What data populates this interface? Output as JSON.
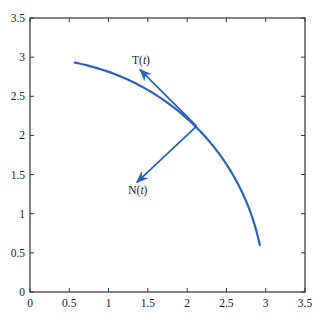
{
  "chart_data": {
    "type": "line",
    "title": "",
    "xlabel": "",
    "ylabel": "",
    "xlim": [
      0,
      3.5
    ],
    "ylim": [
      0,
      3.5
    ],
    "grid": false,
    "x_ticks": [
      "0",
      "0.5",
      "1",
      "1.5",
      "2",
      "2.5",
      "3",
      "3.5"
    ],
    "y_ticks": [
      "0",
      "0.5",
      "1",
      "1.5",
      "2",
      "2.5",
      "3",
      "3.5"
    ],
    "series": [
      {
        "name": "curve",
        "description": "circular arc of radius 3 centered at origin",
        "color": "#2a62b4",
        "x": [
          0.57,
          0.9,
          1.2,
          1.5,
          1.8,
          2.12,
          2.4,
          2.6,
          2.8,
          2.93
        ],
        "y": [
          2.93,
          2.86,
          2.75,
          2.6,
          2.4,
          2.12,
          1.8,
          1.5,
          1.08,
          0.6
        ]
      }
    ],
    "vectors": [
      {
        "name": "T(t)",
        "label_main": "T(",
        "label_var": "t",
        "label_close": ")",
        "from": [
          2.12,
          2.12
        ],
        "to": [
          1.4,
          2.84
        ],
        "color": "#2a62b4"
      },
      {
        "name": "N(t)",
        "label_main": "N(",
        "label_var": "t",
        "label_close": ")",
        "from": [
          2.12,
          2.12
        ],
        "to": [
          1.36,
          1.4
        ],
        "color": "#2a62b4"
      }
    ],
    "annotations": [
      "T(t)",
      "N(t)"
    ],
    "legend": null
  }
}
